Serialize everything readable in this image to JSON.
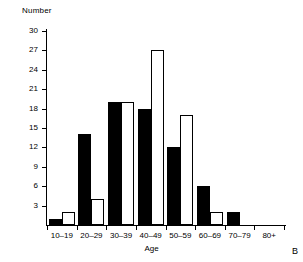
{
  "figure": {
    "panel_letter": "B",
    "y_axis_title": "Number",
    "x_axis_title": "Age"
  },
  "chart_data": {
    "type": "bar",
    "title": "",
    "xlabel": "Age",
    "ylabel": "Number",
    "ylim": [
      0,
      30
    ],
    "yticks": [
      0,
      3,
      6,
      9,
      12,
      15,
      18,
      21,
      24,
      27,
      30
    ],
    "ytick_labels": [
      "",
      "3",
      "6",
      "9",
      "12",
      "15",
      "18",
      "21",
      "24",
      "27",
      "30"
    ],
    "grid": false,
    "legend": null,
    "categories": [
      "10–19",
      "20–29",
      "30–39",
      "40–49",
      "50–59",
      "60–69",
      "70–79",
      "80+"
    ],
    "series": [
      {
        "name": "filled",
        "style": "solid-black",
        "color": "#000000",
        "values": [
          1,
          14,
          19,
          18,
          12,
          6,
          2,
          0
        ]
      },
      {
        "name": "open",
        "style": "hollow-white",
        "color": "#ffffff",
        "edge_color": "#000000",
        "values": [
          2,
          4,
          19,
          27,
          17,
          2,
          0,
          0
        ]
      }
    ]
  }
}
